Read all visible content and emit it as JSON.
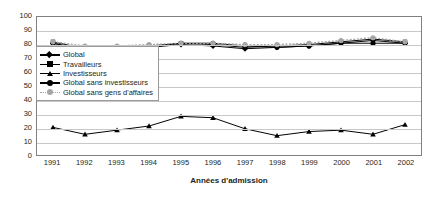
{
  "chart_data": {
    "type": "line",
    "title": "",
    "xlabel": "Années d'admission",
    "ylabel": "",
    "categories": [
      "1991",
      "1992",
      "1993",
      "1994",
      "1995",
      "1996",
      "1997",
      "1998",
      "1999",
      "2000",
      "2001",
      "2002"
    ],
    "ylim": [
      0,
      100
    ],
    "ytick_step": 10,
    "yticks": [
      "100",
      "90",
      "80",
      "70",
      "60",
      "50",
      "40",
      "30",
      "20",
      "10",
      "0"
    ],
    "grid": true,
    "legend_position": "inside-top-left",
    "series": [
      {
        "name": "Global",
        "marker": "diamond",
        "color": "#000000",
        "values": [
          81,
          76,
          76,
          78,
          80,
          79,
          77,
          78,
          79,
          81,
          83,
          81
        ]
      },
      {
        "name": "Travailleurs",
        "marker": "square",
        "color": "#000000",
        "values": [
          82,
          77,
          77,
          79,
          81,
          80,
          78,
          79,
          80,
          82,
          84,
          82
        ]
      },
      {
        "name": "Investisseurs",
        "marker": "triangle",
        "color": "#000000",
        "values": [
          20,
          15,
          18,
          21,
          28,
          27,
          19,
          14,
          17,
          18,
          15,
          22
        ]
      },
      {
        "name": "Global sans investisseurs",
        "marker": "circle",
        "color": "#000000",
        "values": [
          81,
          76,
          75,
          78,
          81,
          81,
          79,
          78,
          79,
          81,
          81,
          81
        ]
      },
      {
        "name": "Global sans gens d'affaires",
        "marker": "circle-gray",
        "color": "#a6a6a6",
        "values": [
          82,
          79,
          79,
          80,
          81,
          81,
          80,
          80,
          81,
          83,
          85,
          82
        ]
      }
    ]
  },
  "colors": {
    "plot_border": "#808080",
    "gridline": "#c8c8c8",
    "text": "#231f20",
    "background": "#ffffff",
    "accent_gray": "#a6a6a6"
  }
}
